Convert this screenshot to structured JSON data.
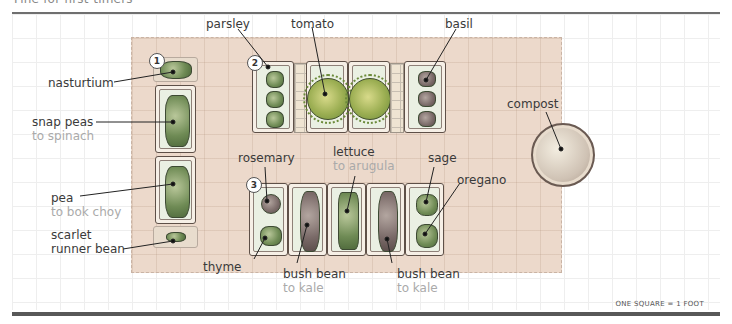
{
  "header": {
    "title": "Fine for first-timers"
  },
  "scale_note": "ONE SQUARE = 1 FOOT",
  "colors": {
    "plot_bg": "#ecd9cb",
    "label": "#3a3a3a",
    "sublabel": "#aaaaaa",
    "rule": "#585858"
  },
  "beds": [
    {
      "number": "1",
      "label": "bed-1"
    },
    {
      "number": "2",
      "label": "bed-2"
    },
    {
      "number": "3",
      "label": "bed-3"
    }
  ],
  "labels": {
    "nasturtium": {
      "name": "nasturtium"
    },
    "snap_peas": {
      "name": "snap peas",
      "succession": "to spinach"
    },
    "pea": {
      "name": "pea",
      "succession": "to bok choy"
    },
    "scarlet_runner": {
      "name": "scarlet",
      "name2": "runner bean"
    },
    "parsley": {
      "name": "parsley"
    },
    "tomato": {
      "name": "tomato"
    },
    "basil": {
      "name": "basil"
    },
    "rosemary": {
      "name": "rosemary"
    },
    "thyme": {
      "name": "thyme"
    },
    "lettuce": {
      "name": "lettuce",
      "succession": "to arugula"
    },
    "bush_bean_1": {
      "name": "bush bean",
      "succession": "to kale"
    },
    "bush_bean_2": {
      "name": "bush bean",
      "succession": "to kale"
    },
    "sage": {
      "name": "sage"
    },
    "oregano": {
      "name": "oregano"
    },
    "compost": {
      "name": "compost"
    }
  }
}
